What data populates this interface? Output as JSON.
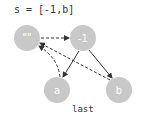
{
  "title": "s = [-1,b]",
  "caption": "last",
  "colors": {
    "node_fill": "#c8c8c8",
    "node_text": "#ffffff",
    "edge": "#333333",
    "text": "#333333"
  },
  "nodes": [
    {
      "id": "empty",
      "label": "\"\"",
      "x": 27,
      "y": 38
    },
    {
      "id": "minus1",
      "label": "-1",
      "x": 83,
      "y": 38
    },
    {
      "id": "a",
      "label": "a",
      "x": 57,
      "y": 90
    },
    {
      "id": "b",
      "label": "b",
      "x": 119,
      "y": 90
    }
  ],
  "edges": [
    {
      "from": "\"\"",
      "to": "-1",
      "style": "dashed"
    },
    {
      "from": "-1",
      "to": "a",
      "style": "solid"
    },
    {
      "from": "-1",
      "to": "b",
      "style": "solid"
    },
    {
      "from": "a",
      "to": "\"\"",
      "style": "dashed"
    },
    {
      "from": "b",
      "to": "\"\"",
      "style": "dashed"
    }
  ]
}
